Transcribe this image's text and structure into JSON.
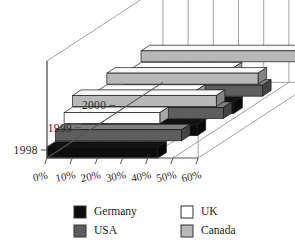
{
  "chart_data": {
    "type": "bar",
    "orientation": "horizontal",
    "style": "3d-stacked-rows",
    "title": "",
    "subtitle": "",
    "xlabel": "",
    "ylabel": "",
    "categories": [
      "1998",
      "1999",
      "2000"
    ],
    "categories_display_order": [
      "2000",
      "1999",
      "1998"
    ],
    "series": [
      {
        "name": "Germany",
        "color": "#0d0d0d",
        "values": [
          44,
          46,
          47
        ]
      },
      {
        "name": "USA",
        "color": "#5e5e5e",
        "values": [
          50,
          53,
          55
        ]
      },
      {
        "name": "UK",
        "color": "#ffffff",
        "values": [
          38,
          39,
          40
        ]
      },
      {
        "name": "Canada",
        "color": "#b8b8b8",
        "values": [
          57,
          60,
          63
        ]
      }
    ],
    "xlim": [
      0,
      60
    ],
    "xticks": [
      0,
      10,
      20,
      30,
      40,
      50,
      60
    ],
    "xtick_labels": [
      "0%",
      "10%",
      "20%",
      "30%",
      "40%",
      "50%",
      "60%"
    ],
    "xtick_suffix": "%",
    "grid": true,
    "legend": {
      "position": "bottom",
      "columns": 2,
      "entries": [
        {
          "label": "Germany",
          "color": "#0d0d0d"
        },
        {
          "label": "UK",
          "color": "#ffffff"
        },
        {
          "label": "USA",
          "color": "#5e5e5e"
        },
        {
          "label": "Canada",
          "color": "#b8b8b8"
        }
      ]
    },
    "colors": {
      "germany": "#0d0d0d",
      "usa": "#5e5e5e",
      "uk": "#ffffff",
      "canada": "#b8b8b8",
      "axis": "#555555",
      "grid": "#8a8a8a",
      "background": "#ffffff",
      "text": "#222222"
    }
  }
}
